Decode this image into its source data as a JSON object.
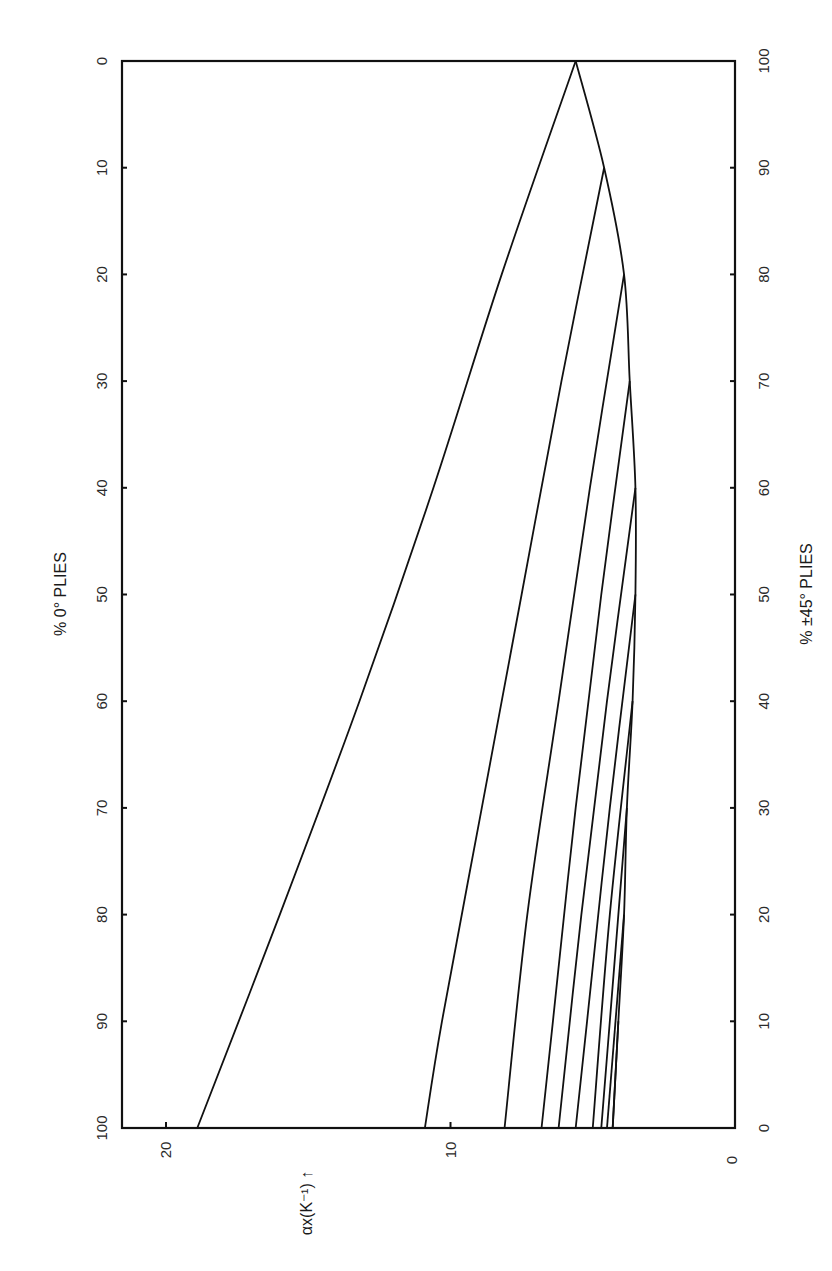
{
  "chart_data": {
    "type": "line",
    "orientation": "rotated-90",
    "title": "",
    "xlabel": "% 0° PLIES",
    "xlabel_secondary": "% ±45° PLIES",
    "ylabel": "αx(K⁻¹) ↑",
    "x_ticks": [
      0,
      10,
      20,
      30,
      40,
      50,
      60,
      70,
      80,
      90,
      100
    ],
    "x_secondary_ticks": [
      100,
      90,
      80,
      70,
      60,
      50,
      40,
      30,
      20,
      10,
      0
    ],
    "y_ticks": [
      0,
      10,
      20
    ],
    "xlim": [
      0,
      100
    ],
    "ylim": [
      0,
      21
    ],
    "grid": false,
    "legend": null,
    "envelope": {
      "name": "0/±45 laminates (no 90° plies)",
      "x": [
        0,
        10,
        20,
        30,
        40,
        50,
        60,
        70,
        80,
        90,
        100
      ],
      "y": [
        5.6,
        4.6,
        3.9,
        3.7,
        3.5,
        3.5,
        3.6,
        3.8,
        3.9,
        4.1,
        4.3
      ]
    },
    "series": [
      {
        "name": "curve-1",
        "x": [
          0,
          20,
          40,
          60,
          80,
          100
        ],
        "y": [
          5.6,
          8.2,
          10.6,
          13.2,
          16.0,
          18.9
        ]
      },
      {
        "name": "curve-2",
        "x": [
          10,
          30,
          50,
          70,
          90,
          100
        ],
        "y": [
          4.6,
          6.1,
          7.5,
          8.9,
          10.3,
          10.9
        ]
      },
      {
        "name": "curve-3",
        "x": [
          20,
          40,
          60,
          80,
          100
        ],
        "y": [
          3.9,
          5.1,
          6.2,
          7.3,
          8.1
        ]
      },
      {
        "name": "curve-4",
        "x": [
          30,
          50,
          70,
          90,
          100
        ],
        "y": [
          3.7,
          4.7,
          5.6,
          6.4,
          6.8
        ]
      },
      {
        "name": "curve-5",
        "x": [
          40,
          60,
          80,
          100
        ],
        "y": [
          3.5,
          4.5,
          5.4,
          6.2
        ]
      },
      {
        "name": "curve-6",
        "x": [
          50,
          70,
          90,
          100
        ],
        "y": [
          3.5,
          4.4,
          5.2,
          5.6
        ]
      },
      {
        "name": "curve-7",
        "x": [
          60,
          80,
          100
        ],
        "y": [
          3.6,
          4.4,
          5.0
        ]
      },
      {
        "name": "curve-8",
        "x": [
          70,
          90,
          100
        ],
        "y": [
          3.8,
          4.4,
          4.7
        ]
      },
      {
        "name": "curve-9",
        "x": [
          80,
          100
        ],
        "y": [
          3.9,
          4.5
        ]
      },
      {
        "name": "curve-10",
        "x": [
          90,
          100
        ],
        "y": [
          4.1,
          4.3
        ]
      }
    ]
  },
  "labels": {
    "top_axis_title": "% 0° PLIES",
    "bottom_axis_title": "% ±45° PLIES",
    "value_axis_title": "αx(K⁻¹) ↑",
    "value_axis_zero": "0"
  }
}
